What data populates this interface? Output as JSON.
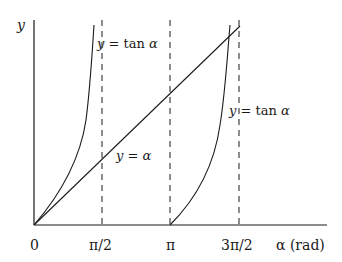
{
  "diagram": {
    "axes": {
      "y_label": "y",
      "x_label": "α (rad)"
    },
    "x_ticks": [
      {
        "label": "0",
        "x": 34
      },
      {
        "label": "π/2",
        "x": 102
      },
      {
        "label": "π",
        "x": 170
      },
      {
        "label": "3π/2",
        "x": 239
      }
    ],
    "curves": [
      {
        "name": "tan-left",
        "label": "y = tan α"
      },
      {
        "name": "line",
        "label": "y = α"
      },
      {
        "name": "tan-right",
        "label": "y = tan α"
      }
    ],
    "colors": {
      "stroke": "#1a1a1a",
      "background": "#ffffff"
    }
  }
}
